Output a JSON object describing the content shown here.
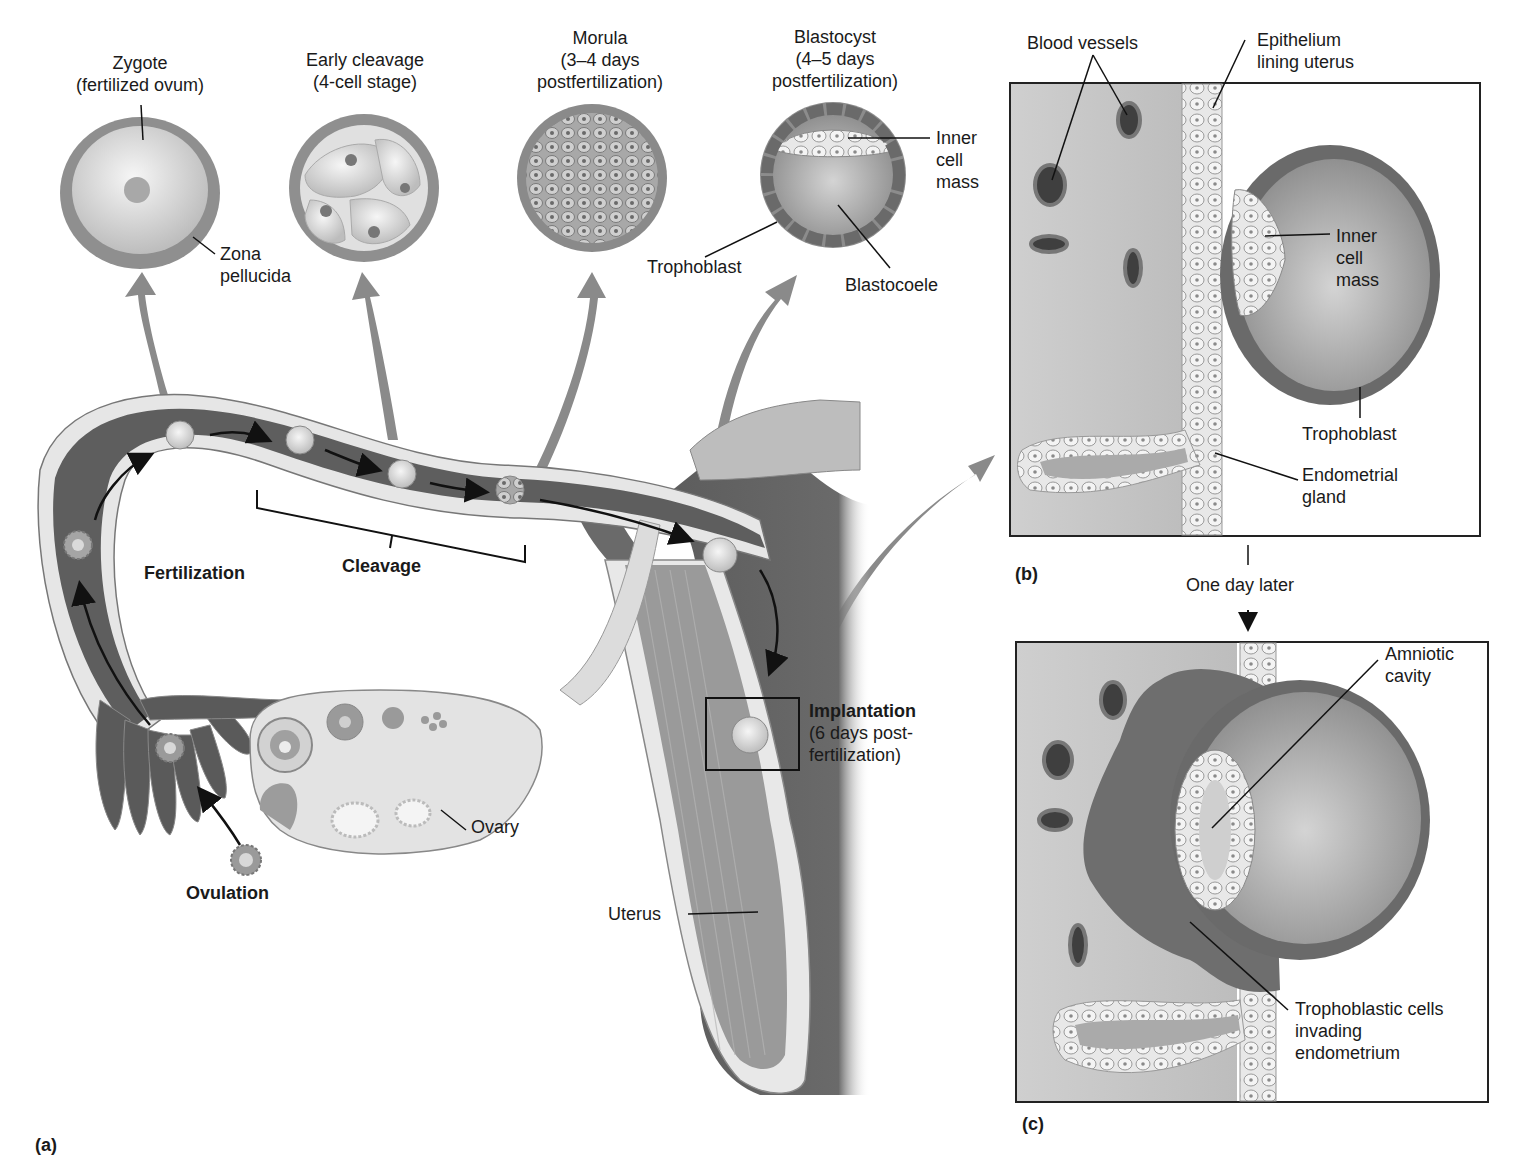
{
  "figure": {
    "panel_labels": {
      "a": "(a)",
      "b": "(b)",
      "c": "(c)"
    },
    "colors": {
      "tissue_dark": "#5a5a5a",
      "tissue_mid": "#8c8c8c",
      "tissue_light": "#d6d6d6",
      "cell_fill": "#efefef",
      "outline": "#2a2a2a",
      "background": "#ffffff"
    }
  },
  "panel_a": {
    "stages": [
      {
        "title": "Zygote",
        "subtitle": "(fertilized ovum)"
      },
      {
        "title": "Early cleavage",
        "subtitle": "(4-cell stage)"
      },
      {
        "title": "Morula",
        "subtitle": "(3–4 days",
        "subtitle2": "postfertilization)"
      },
      {
        "title": "Blastocyst",
        "subtitle": "(4–5 days",
        "subtitle2": "postfertilization)"
      }
    ],
    "zygote_labels": {
      "zona_1": "Zona",
      "zona_2": "pellucida"
    },
    "blastocyst_labels": {
      "icm_1": "Inner",
      "icm_2": "cell",
      "icm_3": "mass",
      "trophoblast": "Trophoblast",
      "blastocoele": "Blastocoele"
    },
    "process_labels": {
      "fertilization": "Fertilization",
      "cleavage": "Cleavage",
      "ovulation": "Ovulation",
      "ovary": "Ovary",
      "uterus": "Uterus",
      "implantation": "Implantation",
      "implantation_sub1": "(6 days post-",
      "implantation_sub2": "fertilization)"
    }
  },
  "panel_b": {
    "labels": {
      "blood_vessels": "Blood vessels",
      "epithelium_1": "Epithelium",
      "epithelium_2": "lining uterus",
      "icm_1": "Inner",
      "icm_2": "cell",
      "icm_3": "mass",
      "trophoblast": "Trophoblast",
      "gland_1": "Endometrial",
      "gland_2": "gland"
    }
  },
  "transition": {
    "label": "One day later"
  },
  "panel_c": {
    "labels": {
      "amniotic_1": "Amniotic",
      "amniotic_2": "cavity",
      "troph_1": "Trophoblastic cells",
      "troph_2": "invading",
      "troph_3": "endometrium"
    }
  }
}
